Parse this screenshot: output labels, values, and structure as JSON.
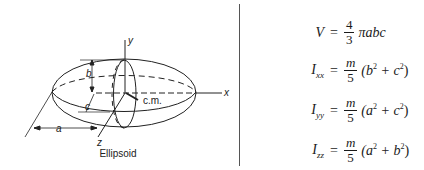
{
  "diagram": {
    "caption": "Ellipsoid",
    "axis_labels": {
      "x": "x",
      "y": "y",
      "z": "z"
    },
    "dimension_labels": {
      "a": "a",
      "b": "b",
      "c": "c"
    },
    "center_of_mass_label": "c.m."
  },
  "equations": [
    {
      "lhs": "V",
      "lhs_sub": "",
      "num": "4",
      "den": "3",
      "rhs": "πabc"
    },
    {
      "lhs": "I",
      "lhs_sub": "xx",
      "num": "m",
      "den": "5",
      "rhs_open": "(b",
      "rhs_mid": " + c",
      "rhs_close": ")"
    },
    {
      "lhs": "I",
      "lhs_sub": "yy",
      "num": "m",
      "den": "5",
      "rhs_open": "(a",
      "rhs_mid": " + c",
      "rhs_close": ")"
    },
    {
      "lhs": "I",
      "lhs_sub": "zz",
      "num": "m",
      "den": "5",
      "rhs_open": "(a",
      "rhs_mid": " + b",
      "rhs_close": ")"
    }
  ],
  "superscript": "2",
  "colors": {
    "ink": "#1a1a1a",
    "background": "#ffffff"
  }
}
